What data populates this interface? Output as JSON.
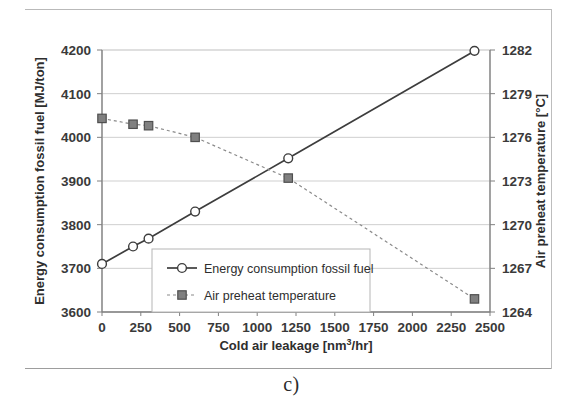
{
  "figure": {
    "caption": "c)"
  },
  "chart_data": {
    "type": "line",
    "title": "",
    "subtitle": "",
    "xlabel": "Cold air leakage [nm3/hr]",
    "xlabel_parts": {
      "pre": "Cold air leakage [nm",
      "sup": "3",
      "post": "/hr]"
    },
    "ylabel": "Energy consumption fossil fuel [MJ/ton]",
    "y2label": "Air preheat temperature [°C]",
    "xlim": [
      0,
      2500
    ],
    "ylim": [
      3600,
      4200
    ],
    "y2lim": [
      1264,
      1282
    ],
    "xticks": [
      0,
      250,
      500,
      750,
      1000,
      1250,
      1500,
      1750,
      2000,
      2250,
      2500
    ],
    "yticks": [
      3600,
      3700,
      3800,
      3900,
      4000,
      4100,
      4200
    ],
    "y2ticks": [
      1264,
      1267,
      1270,
      1273,
      1276,
      1279,
      1282
    ],
    "grid": true,
    "grid_color": "#cfcfcf",
    "legend_position": "inside-lower-left",
    "series": [
      {
        "name": "Energy consumption fossil fuel",
        "axis": "left",
        "marker": "circle-open",
        "line_style": "solid",
        "color": "#3d3d3d",
        "marker_fill": "#ffffff",
        "x": [
          0,
          200,
          300,
          600,
          1200,
          2400
        ],
        "values": [
          3710,
          3750,
          3768,
          3830,
          3952,
          4198
        ]
      },
      {
        "name": "Air preheat temperature",
        "axis": "right",
        "marker": "square-filled",
        "line_style": "dotted",
        "color": "#8a8a8a",
        "marker_fill": "#808080",
        "x": [
          0,
          200,
          300,
          600,
          1200,
          2400
        ],
        "values": [
          1277.3,
          1276.9,
          1276.8,
          1276.0,
          1273.2,
          1264.9
        ]
      }
    ]
  },
  "legend": {
    "items": [
      {
        "label": "Energy consumption fossil fuel",
        "marker": "circle-open"
      },
      {
        "label": "Air preheat temperature",
        "marker": "square-filled"
      }
    ]
  }
}
